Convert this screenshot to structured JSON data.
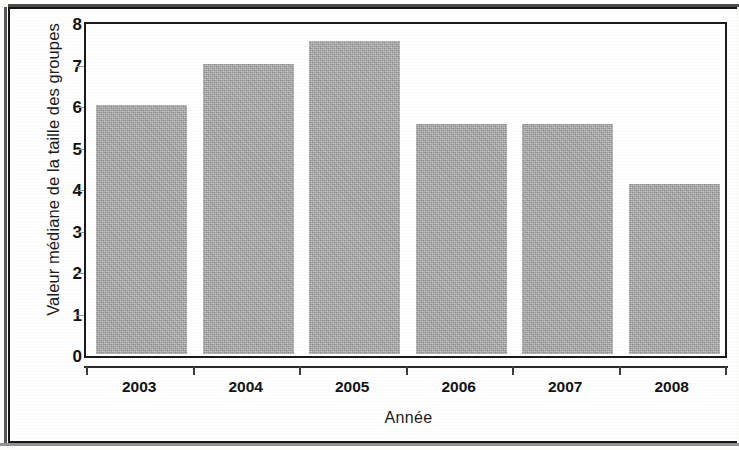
{
  "chart_data": {
    "type": "bar",
    "title": "",
    "subtitle": "",
    "xlabel": "Année",
    "ylabel": "Valeur médiane de la taille des groupes",
    "categories": [
      "2003",
      "2004",
      "2005",
      "2006",
      "2007",
      "2008"
    ],
    "values": [
      6.0,
      7.0,
      7.55,
      5.55,
      5.55,
      4.1
    ],
    "series": [
      {
        "name": "Valeur médiane de la taille des groupes",
        "values": [
          6.0,
          7.0,
          7.55,
          5.55,
          5.55,
          4.1
        ]
      }
    ],
    "ylim": [
      0,
      8
    ],
    "yticks": [
      "0",
      "1",
      "2",
      "3",
      "4",
      "5",
      "6",
      "7",
      "8"
    ],
    "ytick_values": [
      0,
      1,
      2,
      3,
      4,
      5,
      6,
      7,
      8
    ],
    "xticks": [
      "2003",
      "2004",
      "2005",
      "2006",
      "2007",
      "2008"
    ],
    "grid": false,
    "legend": false,
    "legend_position": "none",
    "bar_color": "#a9a9a9",
    "axis_color": "#1a1a1a",
    "background_color": "#ffffff",
    "frame": true
  },
  "axes": {
    "y": {
      "label": "Valeur médiane de la taille des groupes",
      "ticks": [
        {
          "label": "8",
          "value": 8
        },
        {
          "label": "7",
          "value": 7
        },
        {
          "label": "6",
          "value": 6
        },
        {
          "label": "5",
          "value": 5
        },
        {
          "label": "4",
          "value": 4
        },
        {
          "label": "3",
          "value": 3
        },
        {
          "label": "2",
          "value": 2
        },
        {
          "label": "1",
          "value": 1
        },
        {
          "label": "0",
          "value": 0
        }
      ]
    },
    "x": {
      "label": "Année",
      "ticks": [
        {
          "label": "2003"
        },
        {
          "label": "2004"
        },
        {
          "label": "2005"
        },
        {
          "label": "2006"
        },
        {
          "label": "2007"
        },
        {
          "label": "2008"
        }
      ]
    }
  },
  "bars": [
    {
      "category": "2003",
      "value": 6.0
    },
    {
      "category": "2004",
      "value": 7.0
    },
    {
      "category": "2005",
      "value": 7.55
    },
    {
      "category": "2006",
      "value": 5.55
    },
    {
      "category": "2007",
      "value": 5.55
    },
    {
      "category": "2008",
      "value": 4.1
    }
  ]
}
